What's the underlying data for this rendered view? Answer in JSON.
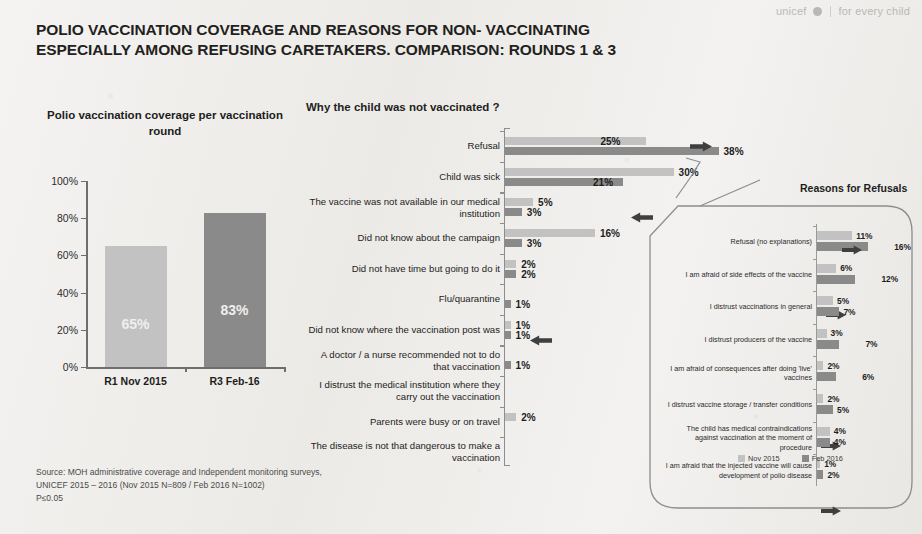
{
  "brand": {
    "wordmark": "unicef",
    "globe_icon": "unicef-globe-icon",
    "tagline": "for every child"
  },
  "deck": {
    "title": "POLIO VACCINATION COVERAGE AND REASONS FOR NON- VACCINATING ESPECIALLY AMONG REFUSING CARETAKERS. COMPARISON: ROUNDS 1 & 3"
  },
  "colors": {
    "series_nov2015": "#c2c2c2",
    "series_feb2016": "#8a8a8a",
    "axis": "#6e6e6e",
    "text": "#1d1d1b",
    "callout_outline": "#8d8d8d",
    "brand_grey": "#b9b8b6"
  },
  "source": {
    "line1": "Source: MOH administrative coverage and Independent monitoring surveys,",
    "line2": "UNICEF 2015 – 2016  (Nov 2015 N=809 / Feb 2016 N=1002)",
    "line3": "P≤0.05"
  },
  "legend": {
    "nov_label": "Nov 2015",
    "feb_label": "Feb 2016"
  },
  "chart_data": [
    {
      "id": "coverage",
      "type": "bar",
      "title": "Polio vaccination coverage per vaccination round",
      "categories": [
        "R1 Nov 2015",
        "R3 Feb-16"
      ],
      "values": [
        65,
        83
      ],
      "value_labels": [
        "65%",
        "83%"
      ],
      "ylabel": "",
      "xlabel": "",
      "ylim": [
        0,
        100
      ],
      "yticks": [
        "0%",
        "20%",
        "40%",
        "60%",
        "80%",
        "100%"
      ],
      "ytick_values": [
        0,
        20,
        40,
        60,
        80,
        100
      ],
      "grid": false,
      "legend_position": "none"
    },
    {
      "id": "reasons-not-vaccinated",
      "type": "bar",
      "orientation": "horizontal",
      "title": "Why the child was not vaccinated ?",
      "categories": [
        "Refusal",
        "Child was sick",
        "The vaccine was not available in our medical institution",
        "Did not know about the campaign",
        "Did not have time but going to do it",
        "Flu/quarantine",
        "Did not know where the vaccination post was",
        "A doctor / a nurse recommended not to do that vaccination",
        "I distrust the medical institution where they carry out the vaccination",
        "Parents were busy or on travel",
        "The disease is not that dangerous to make a vaccination"
      ],
      "series": [
        {
          "name": "Nov 2015",
          "color": "#c2c2c2",
          "values": [
            25,
            30,
            5,
            16,
            2,
            0,
            1,
            0,
            0,
            2,
            0
          ],
          "labels": [
            "25%",
            "30%",
            "5%",
            "16%",
            "2%",
            "",
            "1%",
            "",
            "",
            "2%",
            ""
          ]
        },
        {
          "name": "Feb 2016",
          "color": "#8a8a8a",
          "values": [
            38,
            21,
            3,
            3,
            2,
            1,
            1,
            1,
            0,
            0,
            0
          ],
          "labels": [
            "38%",
            "21%",
            "3%",
            "3%",
            "2%",
            "1%",
            "1%",
            "1%",
            "",
            "",
            ""
          ]
        }
      ],
      "xlim": [
        0,
        40
      ],
      "grid": false,
      "annotations": [
        {
          "name": "increase-arrow-refusal",
          "direction": "right",
          "row": 0
        },
        {
          "name": "decrease-arrow-child-was-sick",
          "direction": "left",
          "row": 1
        },
        {
          "name": "decrease-arrow-campaign",
          "direction": "left",
          "row": 3
        }
      ]
    },
    {
      "id": "reasons-for-refusals",
      "type": "bar",
      "orientation": "horizontal",
      "title": "Reasons for Refusals",
      "categories": [
        "Refusal (no explanations)",
        "I am afraid of side effects of the vaccine",
        "I distrust vaccinations in general",
        "I distrust producers of the vaccine",
        "I am afraid of consequences after doing 'live' vaccines",
        "I distrust vaccine storage / transfer conditions",
        "The child has medical contraindications against vaccination at the moment of procedure",
        "I am afraid that the injected vaccine will cause development of polio disease"
      ],
      "series": [
        {
          "name": "Nov 2015",
          "color": "#c2c2c2",
          "values": [
            11,
            6,
            5,
            3,
            2,
            2,
            4,
            1
          ],
          "labels": [
            "11%",
            "6%",
            "5%",
            "3%",
            "2%",
            "2%",
            "4%",
            "1%"
          ]
        },
        {
          "name": "Feb 2016",
          "color": "#8a8a8a",
          "values": [
            16,
            12,
            7,
            7,
            6,
            5,
            4,
            2
          ],
          "labels": [
            "16%",
            "12%",
            "7%",
            "7%",
            "6%",
            "5%",
            "4%",
            "2%"
          ]
        }
      ],
      "xlim": [
        0,
        20
      ],
      "grid": false,
      "legend_position": "bottom",
      "annotations": [
        {
          "name": "increase-arrow-refusal-no-explanations",
          "direction": "right",
          "row": 0
        },
        {
          "name": "increase-arrow-side-effects",
          "direction": "right",
          "row": 1
        },
        {
          "name": "increase-arrow-distrust-producers",
          "direction": "right",
          "row": 3
        },
        {
          "name": "increase-arrow-live-vaccines",
          "direction": "right",
          "row": 4
        }
      ]
    }
  ]
}
